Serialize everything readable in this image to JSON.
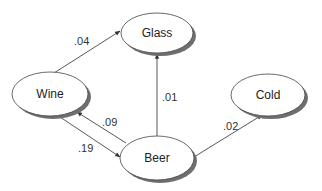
{
  "diagram": {
    "type": "directed-graph",
    "nodes": [
      {
        "id": "glass",
        "label": "Glass",
        "cx": 157,
        "cy": 33,
        "rx": 36,
        "ry": 20
      },
      {
        "id": "wine",
        "label": "Wine",
        "cx": 50,
        "cy": 94,
        "rx": 38,
        "ry": 22
      },
      {
        "id": "beer",
        "label": "Beer",
        "cx": 157,
        "cy": 158,
        "rx": 37,
        "ry": 22
      },
      {
        "id": "cold",
        "label": "Cold",
        "cx": 268,
        "cy": 95,
        "rx": 37,
        "ry": 21
      }
    ],
    "edges": [
      {
        "from": "wine",
        "to": "glass",
        "label": ".04"
      },
      {
        "from": "beer",
        "to": "glass",
        "label": ".01"
      },
      {
        "from": "beer",
        "to": "wine",
        "label": ".09"
      },
      {
        "from": "wine",
        "to": "beer",
        "label": ".19"
      },
      {
        "from": "beer",
        "to": "cold",
        "label": ".02"
      }
    ],
    "colors": {
      "line": "#444444",
      "shadow": "#6e6e6e",
      "fill": "#ffffff",
      "text": "#222222"
    }
  }
}
